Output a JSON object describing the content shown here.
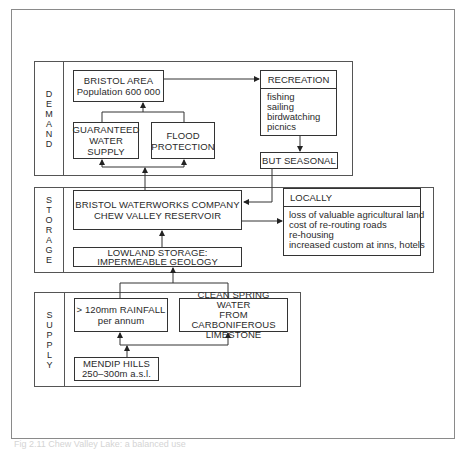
{
  "sections": {
    "demand": "DEMAND",
    "storage": "STORAGE",
    "supply": "SUPPLY"
  },
  "demand": {
    "bristol_area": {
      "title": "BRISTOL AREA",
      "subtitle": "Population 600 000"
    },
    "guaranteed_supply": [
      "GUARANTEED",
      "WATER",
      "SUPPLY"
    ],
    "flood_protection": [
      "FLOOD",
      "PROTECTION"
    ],
    "recreation": {
      "title": "RECREATION",
      "items": [
        "fishing",
        "sailing",
        "birdwatching",
        "picnics"
      ]
    },
    "but_seasonal": "BUT SEASONAL"
  },
  "storage": {
    "company": [
      "BRISTOL WATERWORKS COMPANY",
      "CHEW VALLEY RESERVOIR"
    ],
    "lowland": [
      "LOWLAND STORAGE:",
      "IMPERMEABLE GEOLOGY"
    ],
    "locally": {
      "title": "LOCALLY",
      "items": [
        "loss of valuable agricultural land",
        "cost of re-routing roads",
        "re-housing",
        "increased custom at inns, hotels"
      ]
    }
  },
  "supply": {
    "rainfall": [
      "> 120mm RAINFALL",
      "per annum"
    ],
    "spring": [
      "CLEAN SPRING WATER",
      "FROM CARBONIFEROUS",
      "LIMESTONE"
    ],
    "mendip": [
      "MENDIP HILLS",
      "250–300m a.s.l."
    ]
  },
  "caption": "Fig 2.11   Chew Valley Lake: a balanced use"
}
